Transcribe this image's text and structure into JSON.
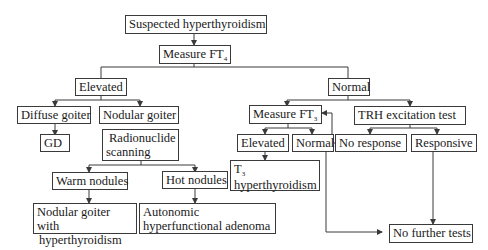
{
  "diagram": {
    "nodes": {
      "suspected": {
        "label": "Suspected hyperthyroidism"
      },
      "measure_ft4": {
        "label": "Measure FT",
        "subscript": "4"
      },
      "elevated_ft4": {
        "label": "Elevated"
      },
      "normal_ft4": {
        "label": "Normal"
      },
      "diffuse_goiter": {
        "label": "Diffuse goiter"
      },
      "nodular_goiter": {
        "label": "Nodular goiter"
      },
      "gd": {
        "label": "GD"
      },
      "radionuclide": {
        "line1": "Radionuclide",
        "line2": "scanning"
      },
      "warm_nodules": {
        "label": "Warm nodules"
      },
      "hot_nodules": {
        "label": "Hot nodules"
      },
      "nodular_hyper": {
        "line1": "Nodular goiter with",
        "line2": "hyperthyroidism"
      },
      "autonomic": {
        "line1": "Autonomic",
        "line2": "hyperfunctional adenoma"
      },
      "measure_ft3": {
        "label": "Measure FT",
        "subscript": "3"
      },
      "trh_test": {
        "label": "TRH excitation test"
      },
      "elevated_ft3": {
        "label": "Elevated"
      },
      "normal_ft3": {
        "label": "Normal"
      },
      "t3_hyper": {
        "line1_prefix": "T",
        "line1_subscript": "3",
        "line2": "hyperthyroidism"
      },
      "no_response": {
        "label": "No response"
      },
      "responsive": {
        "label": "Responsive"
      },
      "no_further": {
        "label": "No further tests"
      }
    },
    "edges": [
      {
        "from": "Suspected hyperthyroidism",
        "to": "Measure FT4"
      },
      {
        "from": "Measure FT4",
        "to": "Elevated"
      },
      {
        "from": "Measure FT4",
        "to": "Normal"
      },
      {
        "from": "Elevated",
        "to": "Diffuse goiter"
      },
      {
        "from": "Elevated",
        "to": "Nodular goiter"
      },
      {
        "from": "Diffuse goiter",
        "to": "GD"
      },
      {
        "from": "Nodular goiter",
        "to": "Radionuclide scanning"
      },
      {
        "from": "Radionuclide scanning",
        "to": "Warm nodules"
      },
      {
        "from": "Radionuclide scanning",
        "to": "Hot nodules"
      },
      {
        "from": "Warm nodules",
        "to": "Nodular goiter with hyperthyroidism"
      },
      {
        "from": "Hot nodules",
        "to": "Autonomic hyperfunctional adenoma"
      },
      {
        "from": "Normal",
        "to": "Measure FT3"
      },
      {
        "from": "Normal",
        "to": "TRH excitation test"
      },
      {
        "from": "Measure FT3",
        "to": "Elevated (FT3)"
      },
      {
        "from": "Measure FT3",
        "to": "Normal (FT3)"
      },
      {
        "from": "Elevated (FT3)",
        "to": "T3 hyperthyroidism"
      },
      {
        "from": "Normal (FT3)",
        "to": "No further tests"
      },
      {
        "from": "TRH excitation test",
        "to": "No response"
      },
      {
        "from": "TRH excitation test",
        "to": "Responsive"
      },
      {
        "from": "No response",
        "to": "Measure FT3"
      },
      {
        "from": "Responsive",
        "to": "No further tests"
      }
    ]
  }
}
